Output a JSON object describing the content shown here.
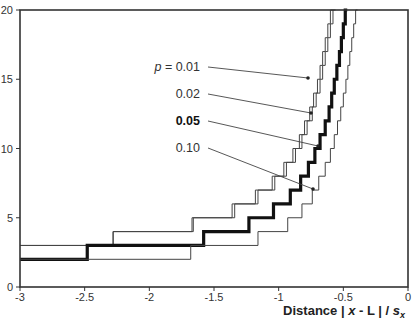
{
  "chart_data": {
    "type": "line",
    "subtype": "step",
    "title": "",
    "xlabel": "Distance | x - L | / s_x",
    "xlabel_parts": {
      "prefix": "Distance | ",
      "x": "x",
      "mid": " - L | / ",
      "s": "s",
      "sub": "x"
    },
    "ylabel": "",
    "xlim": [
      -3,
      0
    ],
    "ylim": [
      0,
      20
    ],
    "xticks": [
      -3,
      -2.5,
      -2,
      -1.5,
      -1,
      -0.5,
      0
    ],
    "xtick_labels": [
      "-3",
      "-2.5",
      "-2",
      "-1.5",
      "-1",
      "-0.5",
      "0"
    ],
    "yticks": [
      0,
      5,
      10,
      15,
      20
    ],
    "ytick_labels": [
      "0",
      "5",
      "10",
      "15",
      "20"
    ],
    "grid": false,
    "legend": "inline annotations with leader lines",
    "series": [
      {
        "name": "p = 0.01",
        "style": "thin",
        "steps": [
          {
            "x_end": -2.28,
            "y": 3
          },
          {
            "x_end": -1.67,
            "y": 4
          },
          {
            "x_end": -1.36,
            "y": 5
          },
          {
            "x_end": -1.18,
            "y": 6
          },
          {
            "x_end": -1.05,
            "y": 7
          },
          {
            "x_end": -0.96,
            "y": 8
          },
          {
            "x_end": -0.89,
            "y": 9
          },
          {
            "x_end": -0.84,
            "y": 10
          },
          {
            "x_end": -0.8,
            "y": 11
          },
          {
            "x_end": -0.76,
            "y": 12
          },
          {
            "x_end": -0.73,
            "y": 13
          },
          {
            "x_end": -0.7,
            "y": 14
          },
          {
            "x_end": -0.68,
            "y": 15
          },
          {
            "x_end": -0.66,
            "y": 16
          },
          {
            "x_end": -0.64,
            "y": 17
          },
          {
            "x_end": -0.62,
            "y": 18
          },
          {
            "x_end": -0.6,
            "y": 19
          },
          {
            "x_end": -0.58,
            "y": 20
          }
        ]
      },
      {
        "name": "0.02",
        "style": "thin",
        "steps": [
          {
            "x_end": -2.28,
            "y": 3
          },
          {
            "x_end": -1.66,
            "y": 4
          },
          {
            "x_end": -1.34,
            "y": 5
          },
          {
            "x_end": -1.16,
            "y": 6
          },
          {
            "x_end": -1.03,
            "y": 7
          },
          {
            "x_end": -0.94,
            "y": 8
          },
          {
            "x_end": -0.87,
            "y": 9
          },
          {
            "x_end": -0.82,
            "y": 10
          },
          {
            "x_end": -0.78,
            "y": 11
          },
          {
            "x_end": -0.74,
            "y": 12
          },
          {
            "x_end": -0.71,
            "y": 13
          },
          {
            "x_end": -0.68,
            "y": 14
          },
          {
            "x_end": -0.66,
            "y": 15
          },
          {
            "x_end": -0.64,
            "y": 16
          },
          {
            "x_end": -0.62,
            "y": 17
          },
          {
            "x_end": -0.6,
            "y": 18
          },
          {
            "x_end": -0.58,
            "y": 19
          },
          {
            "x_end": -0.56,
            "y": 20
          }
        ]
      },
      {
        "name": "0.05",
        "style": "bold",
        "steps": [
          {
            "x_end": -2.48,
            "y": 2
          },
          {
            "x_end": -1.58,
            "y": 3
          },
          {
            "x_end": -1.23,
            "y": 4
          },
          {
            "x_end": -1.04,
            "y": 5
          },
          {
            "x_end": -0.91,
            "y": 6
          },
          {
            "x_end": -0.83,
            "y": 7
          },
          {
            "x_end": -0.77,
            "y": 8
          },
          {
            "x_end": -0.72,
            "y": 9
          },
          {
            "x_end": -0.68,
            "y": 10
          },
          {
            "x_end": -0.64,
            "y": 11
          },
          {
            "x_end": -0.61,
            "y": 12
          },
          {
            "x_end": -0.59,
            "y": 13
          },
          {
            "x_end": -0.57,
            "y": 14
          },
          {
            "x_end": -0.55,
            "y": 15
          },
          {
            "x_end": -0.53,
            "y": 16
          },
          {
            "x_end": -0.515,
            "y": 17
          },
          {
            "x_end": -0.5,
            "y": 18
          },
          {
            "x_end": -0.485,
            "y": 19
          },
          {
            "x_end": -0.47,
            "y": 20
          }
        ]
      },
      {
        "name": "0.10",
        "style": "thin",
        "steps": [
          {
            "x_end": -1.68,
            "y": 2
          },
          {
            "x_end": -1.16,
            "y": 3
          },
          {
            "x_end": -0.93,
            "y": 4
          },
          {
            "x_end": -0.82,
            "y": 5
          },
          {
            "x_end": -0.74,
            "y": 6
          },
          {
            "x_end": -0.69,
            "y": 7
          },
          {
            "x_end": -0.64,
            "y": 8
          },
          {
            "x_end": -0.6,
            "y": 9
          },
          {
            "x_end": -0.57,
            "y": 10
          },
          {
            "x_end": -0.545,
            "y": 11
          },
          {
            "x_end": -0.52,
            "y": 12
          },
          {
            "x_end": -0.5,
            "y": 13
          },
          {
            "x_end": -0.48,
            "y": 14
          },
          {
            "x_end": -0.465,
            "y": 15
          },
          {
            "x_end": -0.45,
            "y": 16
          },
          {
            "x_end": -0.435,
            "y": 17
          },
          {
            "x_end": -0.42,
            "y": 18
          },
          {
            "x_end": -0.405,
            "y": 19
          },
          {
            "x_end": -0.39,
            "y": 20
          }
        ]
      }
    ],
    "annotations": [
      {
        "label_prefix": "p",
        "label": " = 0.01",
        "text_xy": [
          200,
          71
        ],
        "point_xy": [
          308,
          78
        ]
      },
      {
        "label_prefix": "",
        "label": "0.02",
        "text_xy": [
          200,
          98
        ],
        "point_xy": [
          311,
          113
        ]
      },
      {
        "label_prefix": "",
        "label": "0.05",
        "text_xy": [
          200,
          125
        ],
        "point_xy": [
          318,
          146
        ],
        "bold": true
      },
      {
        "label_prefix": "",
        "label": "0.10",
        "text_xy": [
          200,
          152
        ],
        "point_xy": [
          313,
          189
        ]
      }
    ]
  }
}
